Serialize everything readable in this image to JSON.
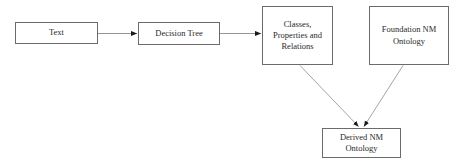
{
  "diagram": {
    "title": "",
    "background_color": "#ffffff",
    "node_border_color": "#6b6b6b",
    "node_fill_color": "#ffffff",
    "edge_color": "#8a8a8a",
    "arrowhead_color": "#1a1a1a",
    "text_color": "#2a2a2a",
    "nodes": [
      {
        "id": "text",
        "label": "Text",
        "shape": "rectangle",
        "x": 15,
        "y": 22,
        "width": 83,
        "height": 22
      },
      {
        "id": "decision_tree",
        "label": "Decision Tree",
        "shape": "rectangle",
        "x": 138,
        "y": 22,
        "width": 82,
        "height": 23
      },
      {
        "id": "classes",
        "label": "Classes,\nProperties and\nRelations",
        "shape": "rectangle",
        "x": 262,
        "y": 6,
        "width": 71,
        "height": 59
      },
      {
        "id": "foundation",
        "label": "Foundation NM\nOntology",
        "shape": "rectangle",
        "x": 369,
        "y": 6,
        "width": 80,
        "height": 59
      },
      {
        "id": "derived",
        "label": "Derived NM\nOntology",
        "shape": "rectangle",
        "x": 322,
        "y": 128,
        "width": 79,
        "height": 30
      }
    ],
    "edges": [
      {
        "id": "edge-text-to-decision-tree",
        "from": "text",
        "to": "decision_tree",
        "label": "",
        "arrowhead": "solid-triangle",
        "style": "straight-horizontal"
      },
      {
        "id": "edge-decision-tree-to-classes",
        "from": "decision_tree",
        "to": "classes",
        "label": "",
        "arrowhead": "solid-triangle",
        "style": "straight-horizontal"
      },
      {
        "id": "edge-classes-to-derived",
        "from": "classes",
        "to": "derived",
        "label": "",
        "arrowhead": "solid-triangle",
        "style": "diagonal"
      },
      {
        "id": "edge-foundation-to-derived",
        "from": "foundation",
        "to": "derived",
        "label": "",
        "arrowhead": "solid-triangle",
        "style": "diagonal"
      }
    ]
  }
}
